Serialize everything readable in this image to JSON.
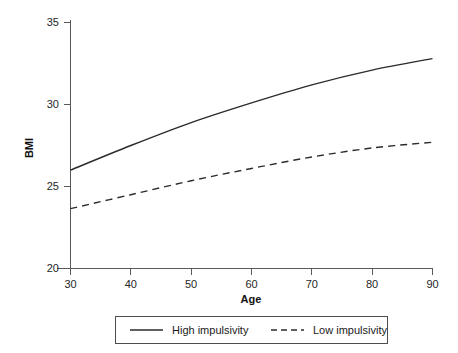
{
  "chart_data": {
    "type": "line",
    "title": "",
    "xlabel": "Age",
    "ylabel": "BMI",
    "xlim": [
      25,
      90
    ],
    "ylim": [
      20,
      35
    ],
    "xticks": [
      30,
      40,
      50,
      60,
      70,
      80,
      90
    ],
    "xtick_labels": [
      "30",
      "40",
      "50",
      "60",
      "70",
      "80",
      "90"
    ],
    "yticks": [
      20,
      25,
      30,
      35
    ],
    "ytick_labels": [
      "20",
      "25",
      "30",
      "35"
    ],
    "grid": false,
    "legend_position": "bottom-center",
    "x": [
      30,
      40,
      50,
      60,
      70,
      80,
      90
    ],
    "series": [
      {
        "name": "High impulsivity",
        "style": "solid",
        "color": "#2b2b2b",
        "values": [
          26.0,
          27.5,
          28.9,
          30.1,
          31.2,
          32.1,
          32.8
        ]
      },
      {
        "name": "Low impulsivity",
        "style": "dashed",
        "color": "#2b2b2b",
        "values": [
          23.65,
          24.5,
          25.35,
          26.1,
          26.8,
          27.35,
          27.7
        ]
      }
    ]
  },
  "axes": {
    "y_label": "BMI",
    "x_label": "Age"
  },
  "legend": {
    "items": [
      {
        "label": "High impulsivity",
        "style": "solid"
      },
      {
        "label": "Low impulsivity",
        "style": "dashed"
      }
    ]
  },
  "ticks": {
    "y": [
      "35",
      "30",
      "25",
      "20"
    ],
    "x": [
      "30",
      "40",
      "50",
      "60",
      "70",
      "80",
      "90"
    ]
  }
}
